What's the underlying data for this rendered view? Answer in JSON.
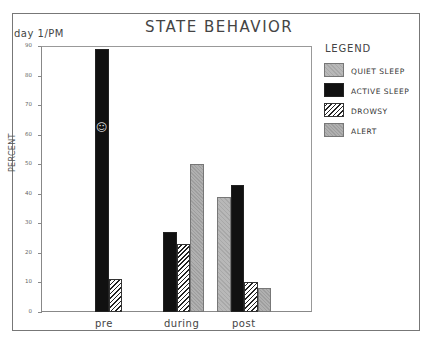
{
  "header": {
    "title": "STATE BEHAVIOR",
    "subtitle": "day 1/PM"
  },
  "axis": {
    "ylabel": "PERCENT",
    "yticks": [
      "0",
      "10",
      "20",
      "30",
      "40",
      "50",
      "60",
      "70",
      "80",
      "90"
    ]
  },
  "legend": {
    "title": "LEGEND",
    "items": [
      {
        "label": "QUIET SLEEP",
        "key": "quiet"
      },
      {
        "label": "ACTIVE SLEEP",
        "key": "active"
      },
      {
        "label": "DROWSY",
        "key": "drowsy"
      },
      {
        "label": "ALERT",
        "key": "alert"
      }
    ]
  },
  "categories": [
    "pre",
    "during",
    "post"
  ],
  "annotation": "☺",
  "chart_data": {
    "type": "bar",
    "title": "STATE BEHAVIOR",
    "subtitle": "day 1/PM",
    "xlabel": "",
    "ylabel": "PERCENT",
    "ylim": [
      0,
      90
    ],
    "yticks": [
      0,
      10,
      20,
      30,
      40,
      50,
      60,
      70,
      80,
      90
    ],
    "categories": [
      "pre",
      "during",
      "post"
    ],
    "series": [
      {
        "name": "QUIET SLEEP",
        "values": [
          0,
          0,
          39
        ]
      },
      {
        "name": "ACTIVE SLEEP",
        "values": [
          89,
          27,
          43
        ]
      },
      {
        "name": "DROWSY",
        "values": [
          11,
          23,
          10
        ]
      },
      {
        "name": "ALERT",
        "values": [
          0,
          50,
          8
        ]
      }
    ],
    "legend_position": "right",
    "grid": false
  }
}
